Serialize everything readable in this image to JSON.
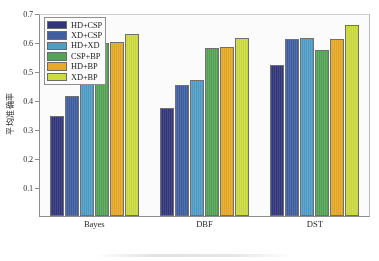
{
  "chart_data": {
    "type": "bar",
    "title": "",
    "xlabel": "",
    "ylabel": "平均准确率",
    "categories": [
      "Bayes",
      "DBF",
      "DST"
    ],
    "ylim": [
      0.0,
      0.7
    ],
    "yticks": [
      "0.1",
      "0.2",
      "0.3",
      "0.4",
      "0.5",
      "0.6",
      "0.7"
    ],
    "ytick_values": [
      0.1,
      0.2,
      0.3,
      0.4,
      0.5,
      0.6,
      0.7
    ],
    "grid": false,
    "legend_position": "upper-left-inside",
    "series": [
      {
        "name": "HD+CSP",
        "color": "#2b2f7a",
        "values": [
          0.345,
          0.372,
          0.521
        ]
      },
      {
        "name": "XD+CSP",
        "color": "#3a5ba0",
        "values": [
          0.414,
          0.452,
          0.612
        ]
      },
      {
        "name": "HD+XD",
        "color": "#4a9cc9",
        "values": [
          0.458,
          0.47,
          0.613
        ]
      },
      {
        "name": "CSP+BP",
        "color": "#4fa352",
        "values": [
          0.595,
          0.578,
          0.571
        ]
      },
      {
        "name": "HD+BP",
        "color": "#e8a91d",
        "values": [
          0.601,
          0.583,
          0.61
        ]
      },
      {
        "name": "XD+BP",
        "color": "#cddc39",
        "values": [
          0.627,
          0.614,
          0.66
        ]
      }
    ]
  },
  "legend": {
    "items": [
      {
        "label": "HD+CSP"
      },
      {
        "label": "XD+CSP"
      },
      {
        "label": "HD+XD"
      },
      {
        "label": "CSP+BP"
      },
      {
        "label": "HD+BP"
      },
      {
        "label": "XD+BP"
      }
    ]
  }
}
